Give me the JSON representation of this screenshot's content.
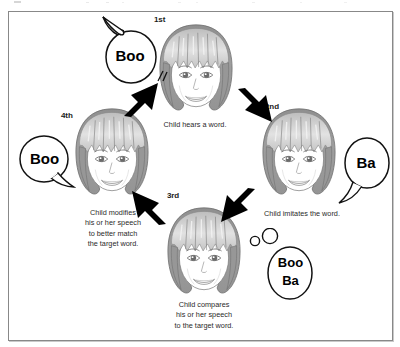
{
  "diagram": {
    "frame_color": "#888888",
    "hair_color": "#9a9a9a",
    "hair_highlight": "#d8d8d8",
    "skin_color": "#ffffff",
    "arrow_color": "#000000",
    "steps": [
      {
        "id": "step-1",
        "order_label": "1st",
        "caption_lines": [
          "Child hears a word."
        ],
        "bubble": {
          "kind": "speech-bubble",
          "text_lines": [
            "Boo"
          ],
          "tail": "up-left"
        }
      },
      {
        "id": "step-2",
        "order_label": "2nd",
        "caption_lines": [
          "Child imitates the word."
        ],
        "bubble": {
          "kind": "speech-bubble",
          "text_lines": [
            "Ba"
          ],
          "tail": "down-left"
        }
      },
      {
        "id": "step-3",
        "order_label": "3rd",
        "caption_lines": [
          "Child compares",
          "his or her speech",
          "to the target word."
        ],
        "bubble": {
          "kind": "thought-bubble",
          "text_lines": [
            "Boo",
            "Ba"
          ],
          "tail": "small-circles-up-left"
        }
      },
      {
        "id": "step-4",
        "order_label": "4th",
        "caption_lines": [
          "Child modifies",
          "his or her speech",
          "to better match",
          "the target word."
        ],
        "bubble": {
          "kind": "speech-bubble",
          "text_lines": [
            "Boo"
          ],
          "tail": "down-right"
        }
      }
    ],
    "arrows": [
      {
        "id": "arrow-to-1",
        "direction": "up-right"
      },
      {
        "id": "arrow-to-2",
        "direction": "down-right"
      },
      {
        "id": "arrow-to-3",
        "direction": "down-left"
      },
      {
        "id": "arrow-to-4",
        "direction": "up-left"
      }
    ]
  }
}
